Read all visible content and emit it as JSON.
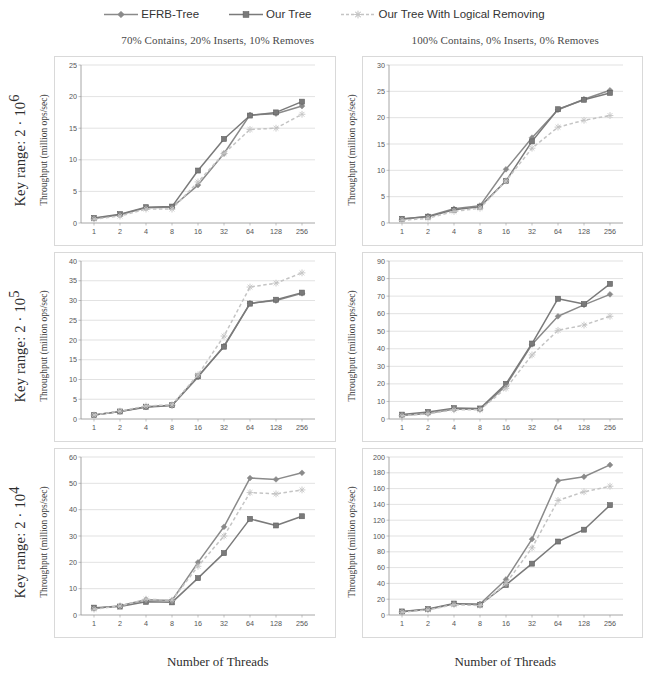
{
  "legend": {
    "entries": [
      {
        "label": "EFRB-Tree",
        "color": "#8a8a8a",
        "marker": "diamond",
        "dash": "none"
      },
      {
        "label": "Our Tree",
        "color": "#7a7a7a",
        "marker": "square",
        "dash": "none"
      },
      {
        "label": "Our Tree With Logical Removing",
        "color": "#c4c4c4",
        "marker": "asterisk",
        "dash": "dashed"
      }
    ]
  },
  "columns": [
    {
      "title": "70% Contains, 20% Inserts, 10% Removes",
      "xlabel": "Number of Threads"
    },
    {
      "title": "100% Contains, 0% Inserts, 0% Removes",
      "xlabel": "Number of Threads"
    }
  ],
  "rows": [
    {
      "label": "Key range: 2 · 10",
      "exponent": "6"
    },
    {
      "label": "Key range: 2 · 10",
      "exponent": "5"
    },
    {
      "label": "Key range: 2 · 10",
      "exponent": "4"
    }
  ],
  "ylabel": "Throughput (million ops/sec)",
  "chart_data": [
    {
      "id": "r1c1",
      "type": "line",
      "title": "70% Contains, 20% Inserts, 10% Removes",
      "row_label": "Key range: 2 · 10^6",
      "xlabel": "Number of Threads",
      "ylabel": "Throughput (million ops/sec)",
      "categories": [
        "1",
        "2",
        "4",
        "8",
        "16",
        "32",
        "64",
        "128",
        "256"
      ],
      "ylim": [
        0,
        25
      ],
      "yticks": [
        0,
        5,
        10,
        15,
        20,
        25
      ],
      "grid": true,
      "legend_position": "top",
      "series": [
        {
          "name": "EFRB-Tree",
          "values": [
            0.7,
            1.3,
            2.4,
            2.5,
            6.0,
            11.0,
            17.1,
            17.3,
            18.5
          ]
        },
        {
          "name": "Our Tree",
          "values": [
            0.8,
            1.4,
            2.5,
            2.6,
            8.3,
            13.3,
            17.0,
            17.5,
            19.2
          ]
        },
        {
          "name": "Our Tree With Logical Removing",
          "values": [
            0.6,
            1.1,
            2.2,
            2.2,
            6.5,
            11.0,
            14.8,
            15.0,
            17.2
          ]
        }
      ]
    },
    {
      "id": "r1c2",
      "type": "line",
      "title": "100% Contains, 0% Inserts, 0% Removes",
      "row_label": "Key range: 2 · 10^6",
      "xlabel": "Number of Threads",
      "ylabel": "Throughput (million ops/sec)",
      "categories": [
        "1",
        "2",
        "4",
        "8",
        "16",
        "32",
        "64",
        "128",
        "256"
      ],
      "ylim": [
        0,
        30
      ],
      "yticks": [
        0,
        5,
        10,
        15,
        20,
        25,
        30
      ],
      "grid": true,
      "legend_position": "top",
      "series": [
        {
          "name": "EFRB-Tree",
          "values": [
            0.7,
            1.3,
            2.7,
            3.3,
            10.2,
            16.2,
            21.5,
            23.5,
            25.2
          ]
        },
        {
          "name": "Our Tree",
          "values": [
            0.8,
            1.2,
            2.5,
            3.1,
            8.0,
            15.5,
            21.6,
            23.4,
            24.7
          ]
        },
        {
          "name": "Our Tree With Logical Removing",
          "values": [
            0.5,
            0.9,
            2.2,
            2.8,
            8.0,
            14.2,
            18.2,
            19.5,
            20.4
          ]
        }
      ]
    },
    {
      "id": "r2c1",
      "type": "line",
      "title": "70% Contains, 20% Inserts, 10% Removes",
      "row_label": "Key range: 2 · 10^5",
      "xlabel": "Number of Threads",
      "ylabel": "Throughput (million ops/sec)",
      "categories": [
        "1",
        "2",
        "4",
        "8",
        "16",
        "32",
        "64",
        "128",
        "256"
      ],
      "ylim": [
        0,
        40
      ],
      "yticks": [
        0,
        5,
        10,
        15,
        20,
        25,
        30,
        35,
        40
      ],
      "grid": true,
      "legend_position": "top",
      "series": [
        {
          "name": "EFRB-Tree",
          "values": [
            1.0,
            1.9,
            3.0,
            3.4,
            10.6,
            18.5,
            29.3,
            30.0,
            31.8
          ]
        },
        {
          "name": "Our Tree",
          "values": [
            1.0,
            1.9,
            3.1,
            3.5,
            10.8,
            18.3,
            29.2,
            30.2,
            32.0
          ]
        },
        {
          "name": "Our Tree With Logical Removing",
          "values": [
            1.0,
            2.0,
            3.3,
            3.6,
            11.2,
            21.0,
            33.4,
            34.4,
            37.0
          ]
        }
      ]
    },
    {
      "id": "r2c2",
      "type": "line",
      "title": "100% Contains, 0% Inserts, 0% Removes",
      "row_label": "Key range: 2 · 10^5",
      "xlabel": "Number of Threads",
      "ylabel": "Throughput (million ops/sec)",
      "categories": [
        "1",
        "2",
        "4",
        "8",
        "16",
        "32",
        "64",
        "128",
        "256"
      ],
      "ylim": [
        0,
        90
      ],
      "yticks": [
        0,
        10,
        20,
        30,
        40,
        50,
        60,
        70,
        80,
        90
      ],
      "grid": true,
      "legend_position": "top",
      "series": [
        {
          "name": "EFRB-Tree",
          "values": [
            2.0,
            3.2,
            5.5,
            5.5,
            19.0,
            42.5,
            58.5,
            65.0,
            71.0
          ]
        },
        {
          "name": "Our Tree",
          "values": [
            2.5,
            4.0,
            6.2,
            6.0,
            20.0,
            43.0,
            68.5,
            65.5,
            77.0
          ]
        },
        {
          "name": "Our Tree With Logical Removing",
          "values": [
            1.8,
            3.0,
            5.2,
            5.2,
            17.5,
            36.5,
            50.5,
            53.5,
            58.5
          ]
        }
      ]
    },
    {
      "id": "r3c1",
      "type": "line",
      "title": "70% Contains, 20% Inserts, 10% Removes",
      "row_label": "Key range: 2 · 10^4",
      "xlabel": "Number of Threads",
      "ylabel": "Throughput (million ops/sec)",
      "categories": [
        "1",
        "2",
        "4",
        "8",
        "16",
        "32",
        "64",
        "128",
        "256"
      ],
      "ylim": [
        0,
        60
      ],
      "yticks": [
        0,
        10,
        20,
        30,
        40,
        50,
        60
      ],
      "grid": true,
      "legend_position": "top",
      "series": [
        {
          "name": "EFRB-Tree",
          "values": [
            2.5,
            3.5,
            5.8,
            5.5,
            20.0,
            33.5,
            52.0,
            51.5,
            54.0
          ]
        },
        {
          "name": "Our Tree",
          "values": [
            2.8,
            3.2,
            5.0,
            4.8,
            14.0,
            23.5,
            36.5,
            34.0,
            37.5
          ]
        },
        {
          "name": "Our Tree With Logical Removing",
          "values": [
            2.2,
            3.4,
            6.0,
            5.6,
            18.5,
            30.0,
            46.5,
            46.0,
            47.5
          ]
        }
      ]
    },
    {
      "id": "r3c2",
      "type": "line",
      "title": "100% Contains, 0% Inserts, 0% Removes",
      "row_label": "Key range: 2 · 10^4",
      "xlabel": "Number of Threads",
      "ylabel": "Throughput (million ops/sec)",
      "categories": [
        "1",
        "2",
        "4",
        "8",
        "16",
        "32",
        "64",
        "128",
        "256"
      ],
      "ylim": [
        0,
        200
      ],
      "yticks": [
        0,
        20,
        40,
        60,
        80,
        100,
        120,
        140,
        160,
        180,
        200
      ],
      "grid": true,
      "legend_position": "top",
      "series": [
        {
          "name": "EFRB-Tree",
          "values": [
            4.0,
            7.0,
            14.0,
            14.0,
            45.0,
            96.0,
            170.0,
            175.0,
            190.0
          ]
        },
        {
          "name": "Our Tree",
          "values": [
            4.5,
            7.5,
            14.5,
            13.0,
            38.0,
            65.0,
            93.0,
            108.0,
            139.0
          ]
        },
        {
          "name": "Our Tree With Logical Removing",
          "values": [
            3.5,
            6.5,
            13.0,
            12.0,
            40.0,
            85.0,
            145.0,
            156.0,
            163.0
          ]
        }
      ]
    }
  ]
}
